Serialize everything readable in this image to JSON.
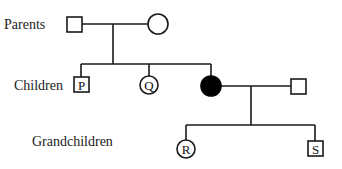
{
  "diagram": {
    "type": "pedigree",
    "generation_labels": {
      "parents": "Parents",
      "children": "Children",
      "grandchildren": "Grandchildren"
    },
    "individuals": [
      {
        "id": "parent-male",
        "sex": "male",
        "shape": "square",
        "affected": false,
        "label": ""
      },
      {
        "id": "parent-female",
        "sex": "female",
        "shape": "circle",
        "affected": false,
        "label": ""
      },
      {
        "id": "P",
        "sex": "male",
        "shape": "square",
        "affected": false,
        "label": "P"
      },
      {
        "id": "Q",
        "sex": "female",
        "shape": "circle",
        "affected": false,
        "label": "Q"
      },
      {
        "id": "affected-daughter",
        "sex": "female",
        "shape": "circle",
        "affected": true,
        "label": ""
      },
      {
        "id": "spouse",
        "sex": "male",
        "shape": "square",
        "affected": false,
        "label": ""
      },
      {
        "id": "R",
        "sex": "female",
        "shape": "circle",
        "affected": false,
        "label": "R"
      },
      {
        "id": "S",
        "sex": "male",
        "shape": "square",
        "affected": false,
        "label": "S"
      }
    ],
    "colors": {
      "line": "#1a1a1a",
      "affected_fill": "#000000",
      "unaffected_fill": "#ffffff"
    }
  }
}
